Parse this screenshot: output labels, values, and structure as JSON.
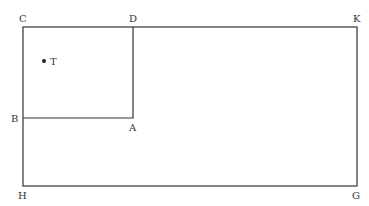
{
  "diagram": {
    "type": "geometry-figure",
    "labels": {
      "C": "C",
      "D": "D",
      "K": "K",
      "B": "B",
      "A": "A",
      "H": "H",
      "G": "G",
      "T": "T"
    },
    "points": {
      "C": [
        23,
        27
      ],
      "D": [
        133,
        27
      ],
      "K": [
        357,
        27
      ],
      "B": [
        23,
        118
      ],
      "A": [
        133,
        118
      ],
      "H": [
        23,
        186
      ],
      "G": [
        357,
        186
      ],
      "T": [
        44,
        61
      ]
    },
    "shapes": [
      {
        "name": "outer-rectangle",
        "vertices": [
          "C",
          "K",
          "G",
          "H"
        ]
      },
      {
        "name": "inner-square",
        "vertices": [
          "C",
          "D",
          "A",
          "B"
        ]
      }
    ]
  }
}
